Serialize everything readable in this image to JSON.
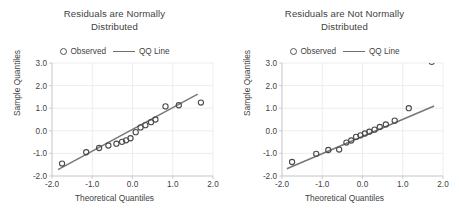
{
  "figure": {
    "panel_count": 2,
    "background": "#ffffff",
    "grid_color": "#e9e9e9",
    "line_color": "#777777",
    "marker_color": "#4a4a4a"
  },
  "legend": {
    "observed_label": "Observed",
    "qqline_label": "QQ Line",
    "observed_marker": "open-circle-marker",
    "qqline_marker": "solid-line-marker"
  },
  "chart_data": [
    {
      "type": "scatter",
      "title": "Residuals are Normally Distributed",
      "title_line1": "Residuals are Normally",
      "title_line2": "Distributed",
      "xlabel": "Theoretical Quantiles",
      "ylabel": "Sample Quantiles",
      "xlim": [
        -2.0,
        2.0
      ],
      "ylim": [
        -2.0,
        3.0
      ],
      "xticks": [
        -2.0,
        -1.0,
        0.0,
        1.0,
        2.0
      ],
      "xticklabels": [
        "-2.0",
        "-1.0",
        "0.0",
        "1.0",
        "2.0"
      ],
      "yticks": [
        -2.0,
        -1.0,
        0.0,
        1.0,
        2.0,
        3.0
      ],
      "yticklabels": [
        "-2.0",
        "-1.0",
        "0.0",
        "1.0",
        "2.0",
        "3.0"
      ],
      "grid": true,
      "legend_position": "above-plot-center",
      "series": [
        {
          "name": "Observed",
          "marker": "open-circle",
          "x": [
            -1.75,
            -1.15,
            -0.83,
            -0.6,
            -0.4,
            -0.26,
            -0.16,
            -0.05,
            0.08,
            0.2,
            0.32,
            0.46,
            0.57,
            0.82,
            1.15,
            1.7
          ],
          "y": [
            -1.45,
            -0.95,
            -0.76,
            -0.65,
            -0.57,
            -0.49,
            -0.42,
            -0.33,
            -0.06,
            0.15,
            0.25,
            0.38,
            0.5,
            1.08,
            1.13,
            1.25
          ]
        },
        {
          "name": "QQ Line",
          "type": "line",
          "x": [
            -1.85,
            1.62
          ],
          "y": [
            -1.72,
            1.62
          ]
        }
      ]
    },
    {
      "type": "scatter",
      "title": "Residuals are Not Normally Distributed",
      "title_line1": "Residuals are Not Normally",
      "title_line2": "Distributed",
      "xlabel": "Theoretical Quantiles",
      "ylabel": "Sample Quantiles",
      "xlim": [
        -2.0,
        2.0
      ],
      "ylim": [
        -2.0,
        3.0
      ],
      "xticks": [
        -2.0,
        -1.0,
        0.0,
        1.0,
        2.0
      ],
      "xticklabels": [
        "-2.0",
        "-1.0",
        "0.0",
        "1.0",
        "2.0"
      ],
      "yticks": [
        -2.0,
        -1.0,
        0.0,
        1.0,
        2.0,
        3.0
      ],
      "yticklabels": [
        "-2.0",
        "-1.0",
        "0.0",
        "1.0",
        "2.0",
        "3.0"
      ],
      "grid": true,
      "legend_position": "above-plot-center",
      "series": [
        {
          "name": "Observed",
          "marker": "open-circle",
          "x": [
            -1.75,
            -1.15,
            -0.85,
            -0.58,
            -0.4,
            -0.28,
            -0.16,
            -0.05,
            0.06,
            0.17,
            0.3,
            0.43,
            0.58,
            0.8,
            1.15,
            1.72
          ],
          "y": [
            -1.38,
            -1.02,
            -0.85,
            -0.83,
            -0.52,
            -0.43,
            -0.27,
            -0.2,
            -0.12,
            -0.04,
            0.05,
            0.17,
            0.28,
            0.45,
            1.0,
            3.05
          ]
        },
        {
          "name": "QQ Line",
          "type": "line",
          "x": [
            -1.88,
            1.78
          ],
          "y": [
            -1.68,
            1.1
          ]
        }
      ]
    }
  ]
}
